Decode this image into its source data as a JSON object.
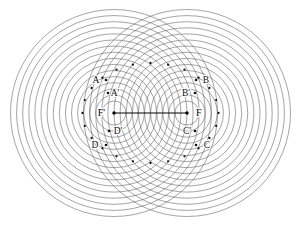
{
  "figure": {
    "background_color": "#ffffff",
    "stroke_color": "#5a5a5a",
    "axis_color": "#000000",
    "dot_color": "#111111",
    "canvas": {
      "width": 299,
      "height": 225
    }
  },
  "foci": [
    {
      "id": "F-prime",
      "label": "F'",
      "x": 114,
      "y": 113,
      "label_x": 105,
      "label_y": 116,
      "anchor": "end"
    },
    {
      "id": "F",
      "label": "F",
      "x": 187,
      "y": 113,
      "label_x": 196,
      "label_y": 116,
      "anchor": "start"
    }
  ],
  "segment": {
    "name": "focal-axis-segment",
    "x1": 114,
    "y1": 113,
    "x2": 187,
    "y2": 113
  },
  "points": [
    {
      "id": "A",
      "label": "A",
      "label_x": 96,
      "label_y": 83,
      "dot_x": 106,
      "dot_y": 80,
      "anchor": "middle"
    },
    {
      "id": "A2",
      "label": "A'",
      "label_x": 115,
      "label_y": 96,
      "dot_x": 108,
      "dot_y": 93,
      "anchor": "middle"
    },
    {
      "id": "B",
      "label": "B",
      "label_x": 206,
      "label_y": 83,
      "dot_x": 196,
      "dot_y": 80,
      "anchor": "middle"
    },
    {
      "id": "B2",
      "label": "B'",
      "label_x": 186,
      "label_y": 96,
      "dot_x": 195,
      "dot_y": 93,
      "anchor": "middle"
    },
    {
      "id": "C",
      "label": "C",
      "label_x": 207,
      "label_y": 148,
      "dot_x": 196,
      "dot_y": 145,
      "anchor": "middle"
    },
    {
      "id": "C2",
      "label": "C'",
      "label_x": 187,
      "label_y": 134,
      "dot_x": 195,
      "dot_y": 131,
      "anchor": "middle"
    },
    {
      "id": "D",
      "label": "D",
      "label_x": 95,
      "label_y": 148,
      "dot_x": 106,
      "dot_y": 145,
      "anchor": "middle"
    },
    {
      "id": "D2",
      "label": "D'",
      "label_x": 118,
      "label_y": 134,
      "dot_x": 109,
      "dot_y": 131,
      "anchor": "middle"
    }
  ],
  "circle_families": {
    "count_per_focus": 16,
    "radius_start": 12,
    "radius_step": 6.1,
    "stroke_width": 0.55
  },
  "marked_intersections": {
    "description": "Dots marking circle-circle intersections tracing an ellipse about both foci",
    "ellipse": {
      "cx": 150.5,
      "cy": 113,
      "rx": 68,
      "ry": 50
    },
    "count": 24
  }
}
